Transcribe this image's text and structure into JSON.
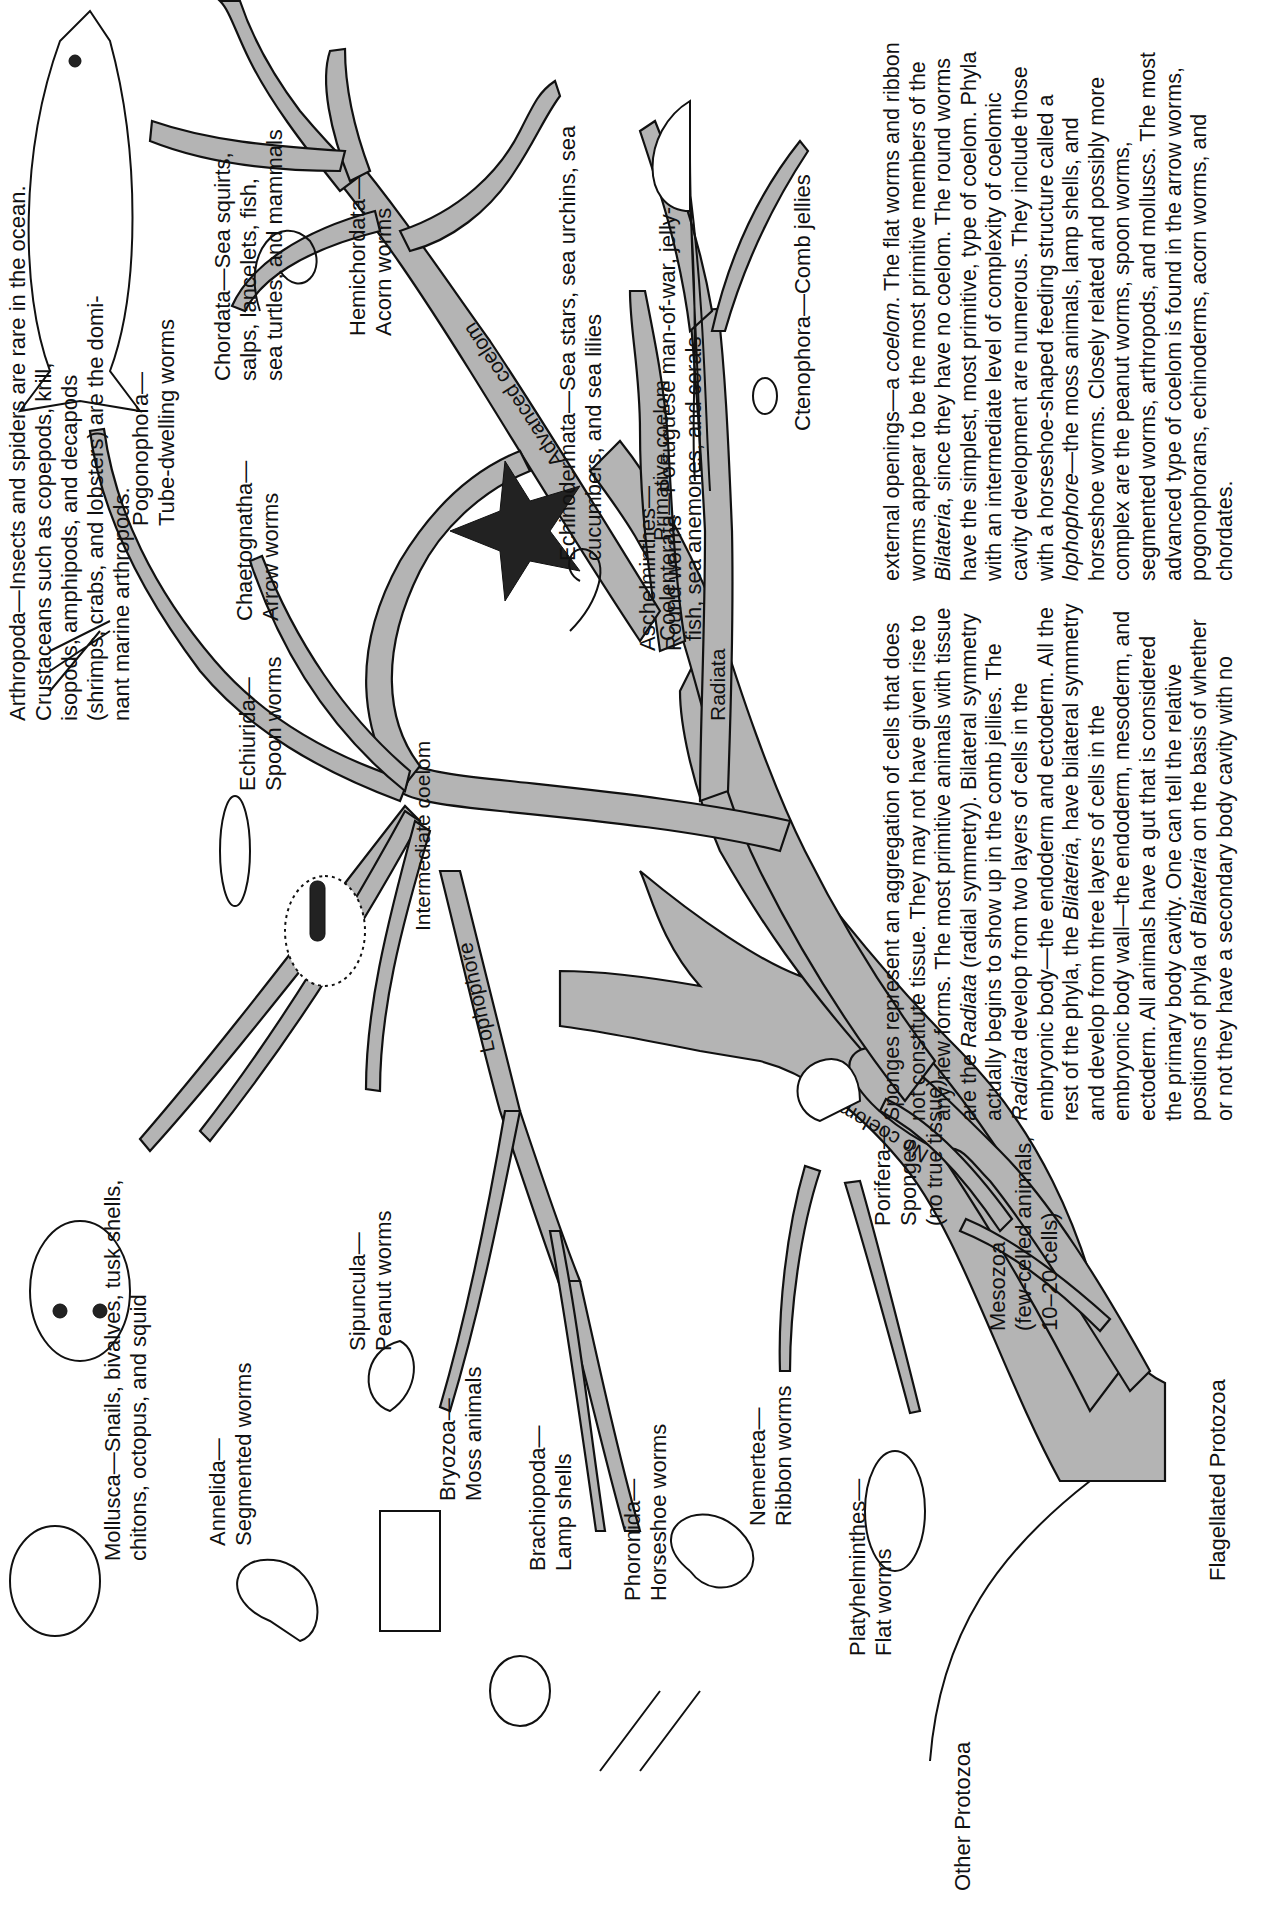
{
  "figure": {
    "orientation": "rotated-90-ccw",
    "root_label": "Flagellated Protozoa",
    "other_root_label": "Other Protozoa",
    "branch_labels": {
      "no_coelom": "No coelom",
      "radiata": "Radiata",
      "primative_coelom": "Primative coelom",
      "advanced_coelom": "Advanced coelom",
      "intermediate_coelom": "Intermediate coelom",
      "lophophore": "Lophophore"
    },
    "phyla": [
      {
        "id": "mollusca",
        "name": "Mollusca",
        "desc": "Snails, bivalves, tusk shells, chitons, octopus, and squid"
      },
      {
        "id": "annelida",
        "name": "Annelida",
        "desc": "Segmented worms"
      },
      {
        "id": "sipuncula",
        "name": "Sipuncula",
        "desc": "Peanut worms"
      },
      {
        "id": "bryozoa",
        "name": "Bryozoa",
        "desc": "Moss animals"
      },
      {
        "id": "brachiopoda",
        "name": "Brachiopoda",
        "desc": "Lamp shells"
      },
      {
        "id": "phoronida",
        "name": "Phoronida",
        "desc": "Horseshoe worms"
      },
      {
        "id": "nemertea",
        "name": "Nemertea",
        "desc": "Ribbon worms"
      },
      {
        "id": "platyhelminthes",
        "name": "Platyhelminthes",
        "desc": "Flat worms"
      },
      {
        "id": "arthropoda",
        "name": "Arthropoda",
        "desc": "Insects and spiders are rare in the ocean. Crustaceans such as copepods, krill, isopods, amphipods, and decapods (shrimps, crabs, and lobsters) are the dominant marine arthropods."
      },
      {
        "id": "echiurida",
        "name": "Echiurida",
        "desc": "Spoon worms"
      },
      {
        "id": "chaetognatha",
        "name": "Chaetognatha",
        "desc": "Arrow worms"
      },
      {
        "id": "pogonophora",
        "name": "Pogonophora",
        "desc": "Tube-dwelling worms"
      },
      {
        "id": "chordata",
        "name": "Chordata",
        "desc": "Sea squirts, salps, lancelets, fish, sea turtles, and mammals"
      },
      {
        "id": "hemichordata",
        "name": "Hemichordata",
        "desc": "Acorn worms"
      },
      {
        "id": "echinodermata",
        "name": "Echinodermata",
        "desc": "Sea stars, sea urchins, sea cucumbers, and sea lilies"
      },
      {
        "id": "aschelminthes",
        "name": "Aschelminthes",
        "desc": "Round worms"
      },
      {
        "id": "coelenterata",
        "name": "Coelenterata",
        "desc": "Portuguese man-of-war, jellyfish, sea anemones, and corals"
      },
      {
        "id": "ctenophora",
        "name": "Ctenophora",
        "desc": "Comb jellies"
      },
      {
        "id": "porifera",
        "name": "Porifera",
        "desc": "Sponges (no true tissue)"
      },
      {
        "id": "mesozoa",
        "name": "Mesozoa",
        "desc": "(few-celled animals, 10–20 cells)"
      }
    ],
    "labels_display": {
      "mollusca_l1": "Mollusca—Snails, bivalves, tusk shells,",
      "mollusca_l2": "chitons, octopus, and squid",
      "annelida_l1": "Annelida—",
      "annelida_l2": "Segmented worms",
      "sipuncula_l1": "Sipuncula—",
      "sipuncula_l2": "Peanut worms",
      "bryozoa_l1": "Bryozoa—",
      "bryozoa_l2": "Moss animals",
      "brachiopoda_l1": "Brachiopoda—",
      "brachiopoda_l2": "Lamp shells",
      "phoronida_l1": "Phoronida—",
      "phoronida_l2": "Horseshoe worms",
      "nemertea_l1": "Nemertea—",
      "nemertea_l2": "Ribbon worms",
      "platy_l1": "Platyhelminthes—",
      "platy_l2": "Flat worms",
      "arthropoda_l1": "Arthropoda—Insects and spiders are rare in the ocean.",
      "arthropoda_l2": "Crustaceans such as copepods, krill,",
      "arthropoda_l3": "isopods, amphipods, and decapods",
      "arthropoda_l4": "(shrimps, crabs, and lobsters) are the domi-",
      "arthropoda_l5": "nant marine arthropods.",
      "echiurida_l1": "Echiurida—",
      "echiurida_l2": "Spoon worms",
      "chaetognatha_l1": "Chaetognatha—",
      "chaetognatha_l2": "Arrow worms",
      "pogonophora_l1": "Pogonophora—",
      "pogonophora_l2": "Tube-dwelling worms",
      "chordata_l1": "Chordata—Sea squirts,",
      "chordata_l2": "salps, lancelets, fish,",
      "chordata_l3": "sea turtles, and mammals",
      "hemichordata_l1": "Hemichordata—",
      "hemichordata_l2": "Acorn worms",
      "echinodermata_l1": "Echinodermata—Sea stars, sea urchins, sea",
      "echinodermata_l2": "cucumbers, and sea lilies",
      "aschelminthes_l1": "Aschelminthes—",
      "aschelminthes_l2": "Round worms",
      "coelenterata_l1": "Coelenterata—Portuguese man-of-war, jelly-",
      "coelenterata_l2": "fish, sea anemones, and corals",
      "ctenophora_l1": "Ctenophora—Comb jellies",
      "porifera_l1": "Porifera—",
      "porifera_l2": "Sponges",
      "porifera_l3": "(no true tissue)",
      "mesozoa_l1": "Mesozoa",
      "mesozoa_l2": "(few-celled animals,",
      "mesozoa_l3": "10–20 cells)"
    },
    "caption": {
      "col1": "Sponges represent an aggregation of cells that does not constitute tissue. They may not have given rise to any new forms. The most primitive animals with tissue are the Radiata (radial symmetry). Bilateral symmetry actually begins to show up in the comb jellies. The Radiata develop from two layers of cells in the embryonic body—the endoderm and ectoderm. All the rest of the phyla, the Bilateria, have bilateral symmetry and develop from three layers of cells in the embryonic body wall—the endoderm, mesoderm, and ectoderm. All animals have a gut that is considered the primary body cavity. One can tell the relative positions of phyla of Bilateria on the basis of whether or not they have a secondary body cavity with no",
      "col2": "external openings—a coelom. The flat worms and ribbon worms appear to be the most primitive members of the Bilateria, since they have no coelom. The round worms have the simplest, most primitive, type of coelom. Phyla with an intermediate level of complexity of coelomic cavity development are numerous. They include those with a horseshoe-shaped feeding structure called a lophophore—the moss animals, lamp shells, and horseshoe worms. Closely related and possibly more complex are the peanut worms, spoon worms, segmented worms, arthropods, and molluscs. The most advanced type of coelom is found in the arrow worms, pogonophorans, echinoderms, acorn worms, and chordates."
    },
    "colors": {
      "branch_fill": "#b4b4b4",
      "outline": "#111111",
      "background": "#ffffff"
    }
  }
}
